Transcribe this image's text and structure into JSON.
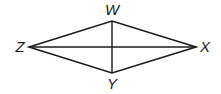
{
  "diagram": {
    "type": "rhombus-with-diagonals",
    "vertices": {
      "W": {
        "label": "W",
        "x": 112,
        "y": 21,
        "label_x": 112,
        "label_y": 15
      },
      "X": {
        "label": "X",
        "x": 196,
        "y": 47,
        "label_x": 205,
        "label_y": 52
      },
      "Y": {
        "label": "Y",
        "x": 112,
        "y": 73,
        "label_x": 112,
        "label_y": 89
      },
      "Z": {
        "label": "Z",
        "x": 29,
        "y": 47,
        "label_x": 20,
        "label_y": 52
      }
    },
    "sides": [
      [
        "Z",
        "W"
      ],
      [
        "W",
        "X"
      ],
      [
        "X",
        "Y"
      ],
      [
        "Y",
        "Z"
      ]
    ],
    "diagonals": [
      [
        "Z",
        "X"
      ],
      [
        "W",
        "Y"
      ]
    ],
    "stroke_color": "#1a1a1a"
  }
}
